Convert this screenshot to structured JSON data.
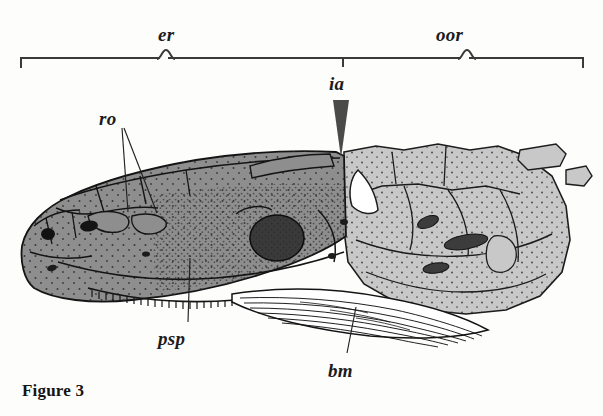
{
  "figure": {
    "caption": "Figure 3",
    "type": "anatomical-line-drawing",
    "background_color": "#fdfdfc",
    "ink_color": "#1c1c1c"
  },
  "bracket": {
    "line_color": "#3a3a38",
    "left_end_x": 20,
    "center_x": 343,
    "right_end_x": 584,
    "baseline_y": 57,
    "segments": [
      {
        "name": "er",
        "label": "er",
        "label_x": 158,
        "label_y": 24,
        "from_x": 20,
        "to_x": 343,
        "brace_x": 163
      },
      {
        "name": "oor",
        "label": "oor",
        "label_x": 436,
        "label_y": 24,
        "from_x": 343,
        "to_x": 584,
        "brace_x": 463
      }
    ]
  },
  "labels": [
    {
      "id": "ro",
      "text": "ro",
      "x": 99,
      "y": 108,
      "marker": "two-leader-lines",
      "leaders": [
        {
          "x1": 122,
          "y1": 128,
          "x2": 128,
          "y2": 212
        },
        {
          "x1": 124,
          "y1": 128,
          "x2": 157,
          "y2": 213
        }
      ]
    },
    {
      "id": "ia",
      "text": "ia",
      "x": 329,
      "y": 73,
      "marker": "solid-downward-wedge",
      "wedge": {
        "top_x1": 333,
        "top_x2": 349,
        "top_y": 100,
        "tip_x": 341,
        "tip_y": 158,
        "color": "#4a4a48"
      }
    },
    {
      "id": "psp",
      "text": "psp",
      "x": 158,
      "y": 328,
      "marker": "single-leader-line",
      "leaders": [
        {
          "x1": 188,
          "y1": 322,
          "x2": 190,
          "y2": 258
        }
      ]
    },
    {
      "id": "bm",
      "text": "bm",
      "x": 328,
      "y": 360,
      "marker": "single-leader-line",
      "leaders": [
        {
          "x1": 347,
          "y1": 353,
          "x2": 356,
          "y2": 307
        }
      ]
    }
  ],
  "anatomy": {
    "regions": [
      {
        "name": "anterior-ethmoid-region",
        "abbrev": "er",
        "fill_color": "#8e8e8e",
        "description": "medium gray stippled snout and cheek plates with black sutures"
      },
      {
        "name": "posterior-otic-occipital-region",
        "abbrev": "oor",
        "fill_color": "#c8c8c8",
        "description": "light gray stippled braincase and suspensorium"
      },
      {
        "name": "branchiomeric-muscle",
        "abbrev": "bm",
        "fill_color": "#ffffff",
        "description": "white striated fibrous muscle bundle along ventral margin"
      },
      {
        "name": "intracranial-joint",
        "abbrev": "ia",
        "fill_color": "#4a4a48",
        "description": "dark wedge marking the joint between the two cranial divisions"
      },
      {
        "name": "rostral-ossicles",
        "abbrev": "ro",
        "fill_color": "#8e8e8e",
        "description": "small plates on the dorsal snout indicated by two leaders"
      }
    ],
    "features": [
      {
        "name": "orbit",
        "fill_color": "#3a3a3a",
        "shape": "large dark oval"
      },
      {
        "name": "naris",
        "fill_color": "#1a1a1a",
        "shape": "small dark oval at snout tip"
      },
      {
        "name": "fenestra",
        "fill_color": "#ffffff",
        "shape": "white notch in posterior region"
      },
      {
        "name": "tooth-row",
        "fill_color": "#1c1c1c",
        "shape": "serrated ventral jaw margin"
      },
      {
        "name": "detached-bone-elements",
        "fill_color": "#c8c8c8",
        "shape": "small isolated plates upper right"
      }
    ]
  }
}
